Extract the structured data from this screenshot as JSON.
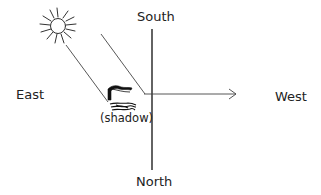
{
  "diagram": {
    "labels": {
      "south": "South",
      "north": "North",
      "east": "East",
      "west": "West",
      "shadow": "(shadow)"
    },
    "elements": {
      "sun": "sun-icon",
      "flag": "flag-icon",
      "shadow": "shadow-shape",
      "sun_ray_line": "sunlight-ray",
      "axis_vertical": "north-south-axis",
      "axis_horizontal_arrow": "east-west-arrow"
    },
    "colors": {
      "stroke": "#222222",
      "background": "#ffffff"
    }
  }
}
